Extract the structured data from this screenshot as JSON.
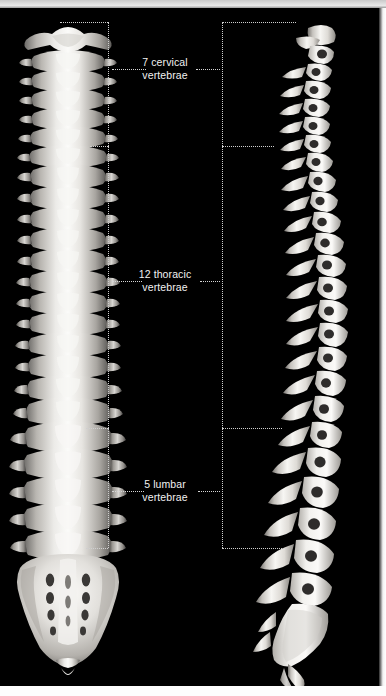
{
  "figure": {
    "background_color": "#000000",
    "bone_color": "#e6e4e0",
    "label_color": "#f2f2f2",
    "guide_color": "#cfcfcf"
  },
  "views": [
    {
      "id": "posterior",
      "name": "posterior-spine-view"
    },
    {
      "id": "lateral",
      "name": "lateral-spine-view"
    }
  ],
  "regions": [
    {
      "id": "cervical",
      "count": "7",
      "line1": "7 cervical",
      "line2": "vertebrae",
      "top": 22,
      "bottom": 146
    },
    {
      "id": "thoracic",
      "count": "12",
      "line1": "12 thoracic",
      "line2": "vertebrae",
      "top": 146,
      "bottom": 428
    },
    {
      "id": "lumbar",
      "count": "5",
      "line1": "5 lumbar",
      "line2": "vertebrae",
      "top": 428,
      "bottom": 548
    }
  ],
  "bracket": {
    "left_x": 108,
    "right_x": 222,
    "lead_left_x1": 112,
    "lead_left_x2": 146,
    "lead_right_x1": 196,
    "lead_right_x2": 220
  }
}
